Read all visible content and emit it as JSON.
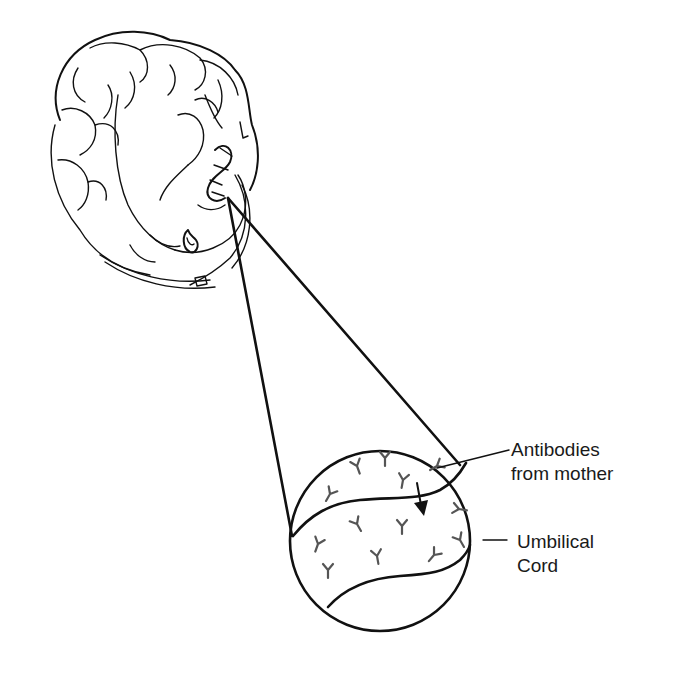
{
  "diagram": {
    "labels": {
      "antibodies_line1": "Antibodies",
      "antibodies_line2": "from mother",
      "cord_line1": "Umbilical",
      "cord_line2": "Cord"
    },
    "icons": {
      "antibody": "Y-shaped antibody glyph",
      "arrow": "down-arrow indicating transfer"
    },
    "colors": {
      "line": "#111111",
      "antibody": "#555555",
      "background": "#ffffff"
    }
  }
}
